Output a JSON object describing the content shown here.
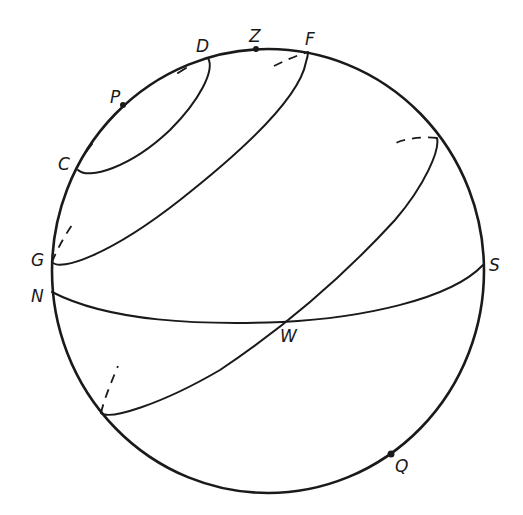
{
  "figure": {
    "stroke_color": "#1a1a1a",
    "background": "#ffffff"
  },
  "labels": {
    "Z": "Z",
    "D": "D",
    "F": "F",
    "P": "P",
    "C": "C",
    "G": "G",
    "N": "N",
    "S": "S",
    "W": "W",
    "Q": "Q"
  },
  "points": [
    {
      "name": "Z",
      "role": "zenith",
      "x": 256,
      "y": 49,
      "marker": "dot"
    },
    {
      "name": "P",
      "role": "pole",
      "x": 123,
      "y": 105,
      "marker": "dot"
    },
    {
      "name": "Q",
      "role": "opposite-pole",
      "x": 391,
      "y": 454,
      "marker": "dot"
    },
    {
      "name": "D",
      "x": 208,
      "y": 58
    },
    {
      "name": "C",
      "x": 78,
      "y": 170
    },
    {
      "name": "F",
      "x": 308,
      "y": 52
    },
    {
      "name": "G",
      "x": 52,
      "y": 262
    },
    {
      "name": "N",
      "x": 52,
      "y": 292
    },
    {
      "name": "S",
      "x": 483,
      "y": 265
    },
    {
      "name": "W",
      "x": 282,
      "y": 322
    }
  ]
}
